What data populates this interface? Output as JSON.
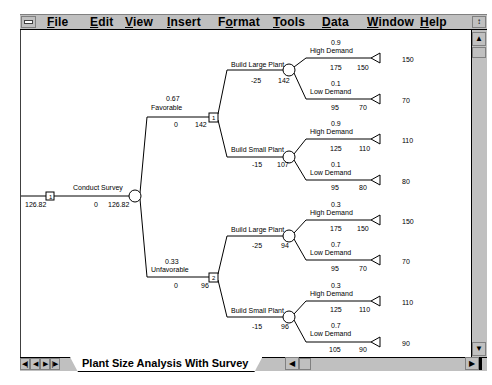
{
  "menu": {
    "items": [
      {
        "label": "File",
        "ul": "F",
        "rest": "ile"
      },
      {
        "label": "Edit",
        "ul": "E",
        "rest": "dit"
      },
      {
        "label": "View",
        "ul": "V",
        "rest": "iew"
      },
      {
        "label": "Insert",
        "ul": "I",
        "rest": "nsert"
      },
      {
        "label": "Format",
        "pre": "F",
        "ul": "o",
        "rest": "rmat"
      },
      {
        "label": "Tools",
        "ul": "T",
        "rest": "ools"
      },
      {
        "label": "Data",
        "ul": "D",
        "rest": "ata"
      },
      {
        "label": "Window",
        "ul": "W",
        "rest": "indow"
      },
      {
        "label": "Help",
        "ul": "H",
        "rest": "elp"
      }
    ]
  },
  "sheet_tab": {
    "label": "Plant Size Analysis With Survey"
  },
  "tree": {
    "root": {
      "value": "126.82",
      "node_label": "1"
    },
    "survey": {
      "label": "Conduct Survey",
      "cost": "0",
      "ev": "126.82"
    },
    "favorable": {
      "prob": "0.67",
      "label": "Favorable",
      "payoff": "0",
      "ev": "142",
      "node_label": "1",
      "large": {
        "label": "Build Large Plant",
        "cost": "-25",
        "ev": "142",
        "high": {
          "prob": "0.9",
          "label": "High Demand",
          "payoff": "175",
          "value": "150",
          "end": "150"
        },
        "low": {
          "prob": "0.1",
          "label": "Low Demand",
          "payoff": "95",
          "value": "70",
          "end": "70"
        }
      },
      "small": {
        "label": "Build Small Plant",
        "cost": "-15",
        "ev": "107",
        "high": {
          "prob": "0.9",
          "label": "High Demand",
          "payoff": "125",
          "value": "110",
          "end": "110"
        },
        "low": {
          "prob": "0.1",
          "label": "Low Demand",
          "payoff": "95",
          "value": "80",
          "end": "80"
        }
      }
    },
    "unfavorable": {
      "prob": "0.33",
      "label": "Unfavorable",
      "payoff": "0",
      "ev": "96",
      "node_label": "2",
      "large": {
        "label": "Build Large Plant",
        "cost": "-25",
        "ev": "94",
        "high": {
          "prob": "0.3",
          "label": "High Demand",
          "payoff": "175",
          "value": "150",
          "end": "150"
        },
        "low": {
          "prob": "0.7",
          "label": "Low Demand",
          "payoff": "95",
          "value": "70",
          "end": "70"
        }
      },
      "small": {
        "label": "Build Small Plant",
        "cost": "-15",
        "ev": "96",
        "high": {
          "prob": "0.3",
          "label": "High Demand",
          "payoff": "125",
          "value": "110",
          "end": "110"
        },
        "low": {
          "prob": "0.7",
          "label": "Low Demand",
          "payoff": "105",
          "value": "90",
          "end": "90"
        }
      }
    }
  }
}
